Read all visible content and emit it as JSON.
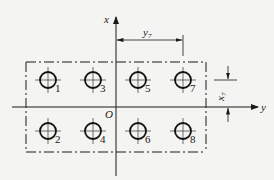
{
  "diagram": {
    "type": "hole-pattern-coordinate-diagram",
    "axes": {
      "x_label": "x",
      "y_label": "y",
      "origin_label": "O"
    },
    "dimensions": {
      "y7": {
        "label_main": "y",
        "label_sub": "7"
      },
      "x7": {
        "label_main": "x",
        "label_sub": "7"
      }
    },
    "holes": [
      {
        "id": "1",
        "label": "1",
        "row": "top",
        "col": 1
      },
      {
        "id": "3",
        "label": "3",
        "row": "top",
        "col": 2
      },
      {
        "id": "5",
        "label": "5",
        "row": "top",
        "col": 3
      },
      {
        "id": "7",
        "label": "7",
        "row": "top",
        "col": 4
      },
      {
        "id": "2",
        "label": "2",
        "row": "bottom",
        "col": 1
      },
      {
        "id": "4",
        "label": "4",
        "row": "bottom",
        "col": 2
      },
      {
        "id": "6",
        "label": "6",
        "row": "bottom",
        "col": 3
      },
      {
        "id": "8",
        "label": "8",
        "row": "bottom",
        "col": 4
      }
    ],
    "colors": {
      "background": "#f4f4f2",
      "line": "#1a1a1a"
    }
  }
}
